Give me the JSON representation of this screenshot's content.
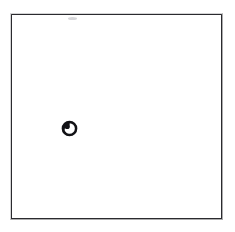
{
  "figure": {
    "background_color": "#ffffff",
    "ink_color": "#1b1b1f",
    "frame": {
      "label": "",
      "stroke_color": "#2b2b2f",
      "stroke_width_px": 1.6,
      "x_px": 11,
      "y_px": 14,
      "width_px": 211,
      "height_px": 205
    },
    "marks": [
      {
        "name": "marked-point",
        "icon": "circle-with-inner-dot-icon",
        "label": "",
        "shape": "ring with filled crescent in upper-left",
        "fill_color": "#121216",
        "interior_color": "#ffffff",
        "center_x_px": 69,
        "center_y_px": 128,
        "diameter_px": 15
      }
    ],
    "artifacts": [
      {
        "name": "scan-smudge",
        "label": "",
        "color": "#787880",
        "x_px": 68,
        "y_px": 17,
        "width_px": 9,
        "height_px": 3
      }
    ]
  }
}
